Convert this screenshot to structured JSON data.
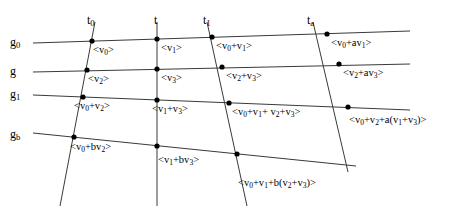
{
  "figure": {
    "type": "lattice-diagram",
    "width": 453,
    "height": 215,
    "background": "#ffffff",
    "line_color": "#3a3a3a",
    "node_color": "#000000",
    "text_color": "#000000"
  },
  "time_axis": {
    "name": "time-lines",
    "labels": [
      {
        "id": "t0",
        "text": "t",
        "sub": "0",
        "x": 87,
        "y": 14
      },
      {
        "id": "t",
        "text": "t",
        "sub": "",
        "x": 154,
        "y": 14
      },
      {
        "id": "t1",
        "text": "t",
        "sub": "1",
        "x": 203,
        "y": 14
      },
      {
        "id": "ta",
        "text": "t",
        "sub": "a",
        "x": 307,
        "y": 14
      }
    ],
    "lines": [
      {
        "id": "t0",
        "x1": 95,
        "y1": 22,
        "x2": 60,
        "y2": 206
      },
      {
        "id": "t",
        "x1": 157,
        "y1": 22,
        "x2": 157,
        "y2": 206
      },
      {
        "id": "t1",
        "x1": 207,
        "y1": 22,
        "x2": 247,
        "y2": 206
      },
      {
        "id": "ta",
        "x1": 313,
        "y1": 22,
        "x2": 348,
        "y2": 172
      }
    ]
  },
  "generation_axis": {
    "name": "generation-lines",
    "labels": [
      {
        "id": "g0",
        "text": "g",
        "sub": "0",
        "x": 10,
        "y": 36
      },
      {
        "id": "g",
        "text": "g",
        "sub": "",
        "x": 10,
        "y": 65
      },
      {
        "id": "g1",
        "text": "g",
        "sub": "1",
        "x": 10,
        "y": 88
      },
      {
        "id": "gb",
        "text": "g",
        "sub": "b",
        "x": 10,
        "y": 128
      }
    ],
    "lines": [
      {
        "id": "g0",
        "x1": 33,
        "y1": 43,
        "x2": 410,
        "y2": 31
      },
      {
        "id": "g",
        "x1": 33,
        "y1": 72,
        "x2": 410,
        "y2": 64
      },
      {
        "id": "g1",
        "x1": 33,
        "y1": 95,
        "x2": 410,
        "y2": 110
      },
      {
        "id": "gb",
        "x1": 33,
        "y1": 133,
        "x2": 356,
        "y2": 166
      }
    ]
  },
  "nodes": [
    {
      "id": "n-t0-g0",
      "x": 92,
      "y": 41
    },
    {
      "id": "n-t-g0",
      "x": 157,
      "y": 39
    },
    {
      "id": "n-t1-g0",
      "x": 212,
      "y": 37
    },
    {
      "id": "n-ta-g0",
      "x": 327,
      "y": 34
    },
    {
      "id": "n-t0-g",
      "x": 87,
      "y": 70
    },
    {
      "id": "n-t-g",
      "x": 157,
      "y": 69
    },
    {
      "id": "n-t1-g",
      "x": 222,
      "y": 67
    },
    {
      "id": "n-ta-g",
      "x": 339,
      "y": 64
    },
    {
      "id": "n-t0-g1",
      "x": 83,
      "y": 97
    },
    {
      "id": "n-t-g1",
      "x": 157,
      "y": 100
    },
    {
      "id": "n-t1-g1",
      "x": 229,
      "y": 103
    },
    {
      "id": "n-ta-g1",
      "x": 348,
      "y": 107
    },
    {
      "id": "n-t0-gb",
      "x": 74,
      "y": 137
    },
    {
      "id": "n-t-gb",
      "x": 157,
      "y": 146
    },
    {
      "id": "n-t1-gb",
      "x": 237,
      "y": 154
    }
  ],
  "node_labels": [
    {
      "id": "lbl-v0",
      "x": 93,
      "y": 45,
      "html": "&lt;v<sub>0</sub>&gt;"
    },
    {
      "id": "lbl-v1",
      "x": 161,
      "y": 43,
      "html": "&lt;v<sub>1</sub>&gt;"
    },
    {
      "id": "lbl-v0-v1",
      "x": 216,
      "y": 41,
      "html": "&lt;v<sub>0</sub>+v<sub>1</sub>&gt;"
    },
    {
      "id": "lbl-v0-av1",
      "x": 331,
      "y": 38,
      "html": "&lt;v<sub>0</sub>+av<sub>1</sub>&gt;"
    },
    {
      "id": "lbl-v2",
      "x": 88,
      "y": 74,
      "html": "&lt;v<sub>2</sub>&gt;"
    },
    {
      "id": "lbl-v3",
      "x": 161,
      "y": 73,
      "html": "&lt;v<sub>3</sub>&gt;"
    },
    {
      "id": "lbl-v2-v3",
      "x": 226,
      "y": 71,
      "html": "&lt;v<sub>2</sub>+v<sub>3</sub>&gt;"
    },
    {
      "id": "lbl-v2-av3",
      "x": 343,
      "y": 68,
      "html": "&lt;v<sub>2</sub>+av<sub>3</sub>&gt;"
    },
    {
      "id": "lbl-v0-v2",
      "x": 74,
      "y": 101,
      "html": "&lt;v<sub>0</sub>+v<sub>2</sub>&gt;"
    },
    {
      "id": "lbl-v1-v3",
      "x": 152,
      "y": 104,
      "html": "&lt;v<sub>1</sub>+v<sub>3</sub>&gt;"
    },
    {
      "id": "lbl-sum-all",
      "x": 232,
      "y": 107,
      "html": "&lt;v<sub>0</sub>+v<sub>1</sub>+ v<sub>2</sub>+v<sub>3</sub>&gt;"
    },
    {
      "id": "lbl-v0-v2-a",
      "x": 349,
      "y": 115,
      "html": "&lt;v<sub>0</sub>+v<sub>2</sub>+a(v<sub>1</sub>+v<sub>3</sub>)&gt;"
    },
    {
      "id": "lbl-v0-bv2",
      "x": 70,
      "y": 142,
      "html": "&lt;v<sub>0</sub>+bv<sub>2</sub>&gt;"
    },
    {
      "id": "lbl-v1-bv3",
      "x": 158,
      "y": 155,
      "html": "&lt;v<sub>1</sub>+bv<sub>3</sub>&gt;"
    },
    {
      "id": "lbl-v0-v1-b",
      "x": 238,
      "y": 178,
      "html": "&lt;v<sub>0</sub>+v<sub>1</sub>+b(v<sub>2</sub>+v<sub>3</sub>)&gt;"
    }
  ]
}
